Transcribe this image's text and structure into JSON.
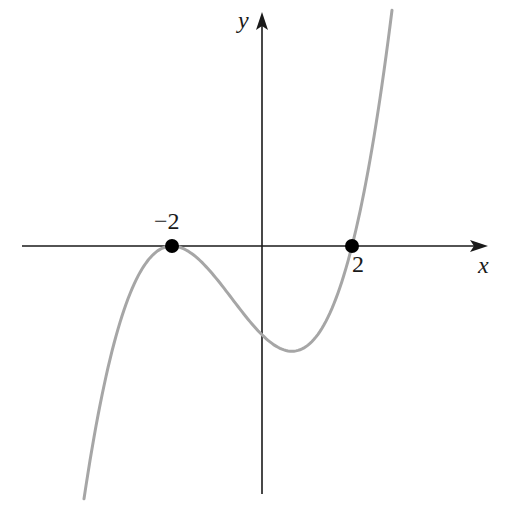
{
  "figure": {
    "type": "function-graph",
    "axes": {
      "x_label": "x",
      "y_label": "y",
      "axis_color": "#1a1a1a"
    },
    "curve": {
      "color": "#a6a6a6",
      "description": "cubic touching x-axis at -2 and crossing at 2"
    },
    "points": [
      {
        "x": -2,
        "y": 0,
        "label": "−2"
      },
      {
        "x": 2,
        "y": 0,
        "label": "2"
      }
    ],
    "point_color": "#000000"
  },
  "chart_data": {
    "type": "line",
    "title": "",
    "xlabel": "x",
    "ylabel": "y",
    "function": "y = k(x+2)^2(x-2), k>0",
    "x_intercepts": [
      -2,
      2
    ],
    "tick_labels": [
      "−2",
      "2"
    ],
    "local_max": {
      "x": -2,
      "y": 0
    },
    "local_min": {
      "x": 0.667,
      "y": "negative"
    },
    "grid": false,
    "legend": null
  }
}
